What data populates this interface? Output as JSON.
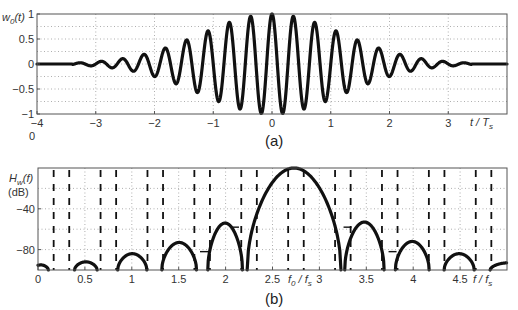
{
  "chart_data": [
    {
      "panel": "(a)",
      "type": "line",
      "ylabel": "w0(t)",
      "xlabel": "t / Ts",
      "xlim": [
        -4,
        4
      ],
      "ylim": [
        -1,
        1
      ],
      "xticks": [
        -4,
        -3,
        -2,
        -1,
        0,
        1,
        2,
        3
      ],
      "xtick_labels": [
        "-4",
        "-3",
        "-2",
        "-1",
        "0",
        "1",
        "2",
        "3"
      ],
      "yticks": [
        1,
        0.5,
        0,
        -0.5,
        -1
      ],
      "ytick_labels": [
        "1",
        "0.5",
        "0",
        "-0.5",
        "-1"
      ],
      "extra_label": "0",
      "grid": true,
      "signal": {
        "description": "modulated pulse: envelope(t) * cos(2*pi*fc*t)",
        "carrier_cycles_per_Ts": 2.75,
        "envelope_width": 1.7,
        "support": 3.4
      },
      "envelope_peaks": {
        "t": [
          0,
          0.36,
          0.73,
          1.09,
          1.45,
          1.82,
          2.18,
          2.55,
          2.91,
          3.27
        ],
        "value": [
          1.0,
          0.92,
          0.8,
          0.64,
          0.46,
          0.32,
          0.2,
          0.12,
          0.06,
          0.02
        ]
      }
    },
    {
      "panel": "(b)",
      "type": "line",
      "ylabel": "Hw(f) (dB)",
      "xlabel": "f / fs",
      "xlim": [
        0,
        5
      ],
      "ylim": [
        -100,
        0
      ],
      "xticks": [
        0,
        0.5,
        1,
        1.5,
        2,
        2.5,
        3,
        3.5,
        4,
        4.5
      ],
      "xtick_labels": [
        "0",
        "0.5",
        "1",
        "1.5",
        "2",
        "2.5",
        "3",
        "3.5",
        "4",
        "4.5"
      ],
      "yticks": [
        -40,
        -80
      ],
      "ytick_labels": [
        "-40",
        "-80"
      ],
      "annotation": "f0 / fs",
      "f0_over_fs": 2.72,
      "grid": true,
      "lobes": [
        {
          "start": -0.05,
          "end": 0.11,
          "peak_db": -95
        },
        {
          "start": 0.39,
          "end": 0.63,
          "peak_db": -92
        },
        {
          "start": 0.85,
          "end": 1.16,
          "peak_db": -84
        },
        {
          "start": 1.32,
          "end": 1.69,
          "peak_db": -73
        },
        {
          "start": 1.81,
          "end": 2.18,
          "peak_db": -54
        },
        {
          "start": 2.23,
          "end": 3.23,
          "peak_db": 0
        },
        {
          "start": 3.27,
          "end": 3.69,
          "peak_db": -53
        },
        {
          "start": 3.81,
          "end": 4.17,
          "peak_db": -72
        },
        {
          "start": 4.33,
          "end": 4.65,
          "peak_db": -84
        },
        {
          "start": 4.82,
          "end": 5.2,
          "peak_db": -93
        }
      ],
      "dashed_verticals": [
        0.167,
        0.333,
        0.667,
        0.833,
        1.167,
        1.333,
        1.667,
        1.833,
        2.167,
        2.333,
        2.667,
        2.833,
        3.167,
        3.333,
        3.667,
        3.833,
        4.167,
        4.333,
        4.667,
        4.833
      ],
      "short_marks": [
        {
          "f": 1.77,
          "db": -82
        },
        {
          "f": 2.1,
          "db": -58
        },
        {
          "f": 3.3,
          "db": -58
        },
        {
          "f": 3.78,
          "db": -82
        }
      ]
    }
  ],
  "captions": {
    "a": "(a)",
    "b": "(b)"
  }
}
